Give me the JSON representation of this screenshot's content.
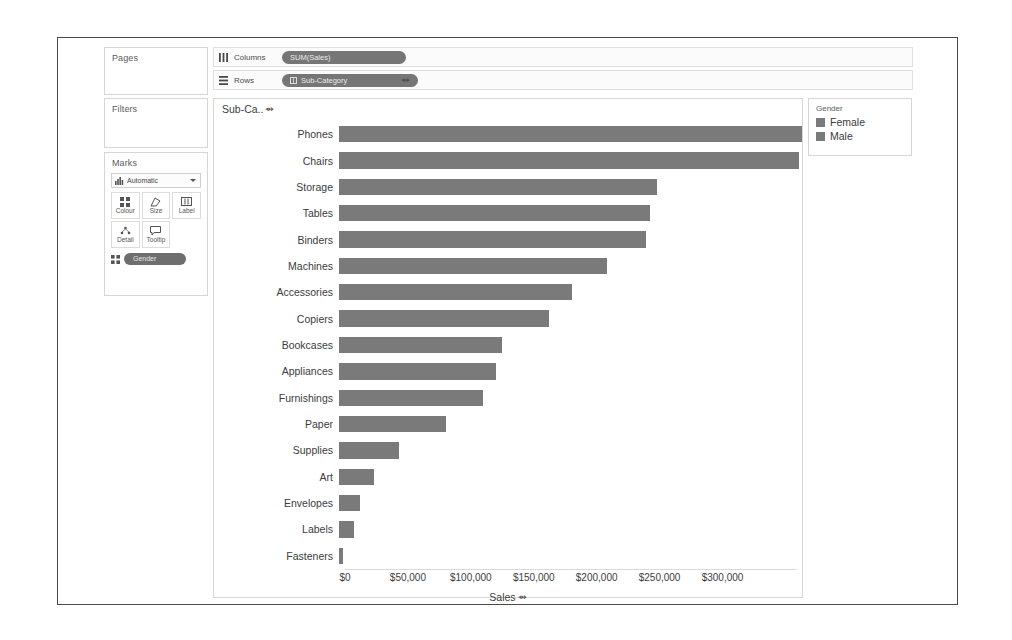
{
  "shelves": {
    "pages": {
      "title": "Pages"
    },
    "filters": {
      "title": "Filters"
    },
    "columns": {
      "label": "Columns",
      "icon": "columns-icon",
      "pill": "SUM(Sales)"
    },
    "rows": {
      "label": "Rows",
      "icon": "rows-icon",
      "pill": "Sub-Category",
      "sort_glyph": "⇴"
    }
  },
  "marks": {
    "title": "Marks",
    "mark_type": "Automatic",
    "mark_type_icon": "bar-chart-icon",
    "buttons": [
      {
        "label": "Colour",
        "icon": "colour-icon"
      },
      {
        "label": "Size",
        "icon": "size-icon"
      },
      {
        "label": "Label",
        "icon": "label-icon"
      },
      {
        "label": "Detail",
        "icon": "detail-icon"
      },
      {
        "label": "Tooltip",
        "icon": "tooltip-icon"
      }
    ],
    "encoding_pill": {
      "label": "Gender",
      "icon": "colour-icon"
    }
  },
  "legend": {
    "title": "Gender",
    "items": [
      {
        "label": "Female",
        "colour": "#7a7a7a"
      },
      {
        "label": "Male",
        "colour": "#7a7a7a"
      }
    ]
  },
  "viz": {
    "row_header": "Sub-Ca..",
    "row_header_sort_glyph": "⇴",
    "axis_title": "Sales",
    "axis_title_sort_glyph": "⇴"
  },
  "chart_data": {
    "type": "bar",
    "title": "",
    "orientation": "horizontal",
    "xlabel": "Sales",
    "ylabel": "Sub-Category",
    "xlim": [
      0,
      360000
    ],
    "grid": false,
    "legend_position": "right",
    "tick_labels": [
      "$0",
      "$50,000",
      "$100,000",
      "$150,000",
      "$200,000",
      "$250,000",
      "$300,000"
    ],
    "tick_values": [
      0,
      50000,
      100000,
      150000,
      200000,
      250000,
      300000
    ],
    "bar_colour": "#7a7a7a",
    "categories": [
      "Phones",
      "Chairs",
      "Storage",
      "Tables",
      "Binders",
      "Machines",
      "Accessories",
      "Copiers",
      "Bookcases",
      "Appliances",
      "Furnishings",
      "Paper",
      "Supplies",
      "Art",
      "Envelopes",
      "Labels",
      "Fasteners"
    ],
    "values": [
      360000,
      358000,
      247000,
      242000,
      239000,
      208000,
      181000,
      163000,
      127000,
      122000,
      112000,
      83000,
      47000,
      27000,
      16000,
      12000,
      3000
    ]
  }
}
